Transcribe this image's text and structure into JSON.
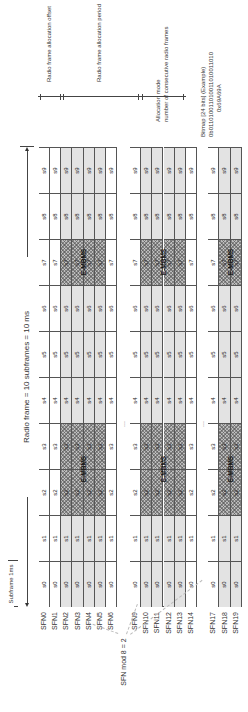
{
  "diagram": {
    "orientation": "rotated-90-ccw",
    "header": {
      "radio_frame_label": "Radio frame = 10 subframes = 10 ms",
      "subframe_label": "Subframe 1ms"
    },
    "subframes": [
      "s0",
      "s1",
      "s2",
      "s3",
      "s4",
      "s5",
      "s6",
      "s7",
      "s8",
      "s9"
    ],
    "mbsfn_subframes": [
      "s2",
      "s3",
      "s7"
    ],
    "mbsfn_label": "E-MBMS",
    "groups": [
      {
        "rows": [
          {
            "sfn": "SFN0",
            "shaded": false
          },
          {
            "sfn": "SFN1",
            "shaded": false
          },
          {
            "sfn": "SFN2",
            "shaded": true
          },
          {
            "sfn": "SFN3",
            "shaded": true
          },
          {
            "sfn": "SFN4",
            "shaded": true
          },
          {
            "sfn": "SFN5",
            "shaded": true
          },
          {
            "sfn": "SFN6",
            "shaded": false
          }
        ]
      },
      {
        "rows": [
          {
            "sfn": "SFN9",
            "shaded": false
          },
          {
            "sfn": "SFN10",
            "shaded": true
          },
          {
            "sfn": "SFN11",
            "shaded": true
          },
          {
            "sfn": "SFN12",
            "shaded": true
          },
          {
            "sfn": "SFN13",
            "shaded": true
          },
          {
            "sfn": "SFN14",
            "shaded": false
          }
        ]
      },
      {
        "rows": [
          {
            "sfn": "SFN17",
            "shaded": false
          },
          {
            "sfn": "SFN18",
            "shaded": true
          },
          {
            "sfn": "SFN19",
            "shaded": true
          }
        ]
      }
    ],
    "ellipsis": "...",
    "sfn_mod_label": "SFN mod 8 = 2",
    "annotations": {
      "offset": "Radio frame allocation offset",
      "period": "Radio frame allocation period",
      "alloc_mode_line1": "Allocation mode",
      "alloc_mode_line2": "number of consecutive radio frames",
      "bitmap_line1": "Bitmap [24 bits] (Example)",
      "bitmap_line2": "0b011010011010011010011010",
      "bitmap_line3": "0x69A69A"
    }
  }
}
